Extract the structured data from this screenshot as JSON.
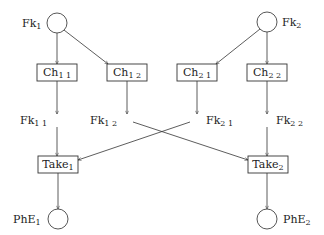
{
  "diagram": {
    "type": "petri-net",
    "places": [
      {
        "id": "Fk1",
        "base": "Fk",
        "sub": "1",
        "cx": 57,
        "cy": 23,
        "r": 10,
        "label_side": "left"
      },
      {
        "id": "Fk2",
        "base": "Fk",
        "sub": "2",
        "cx": 267,
        "cy": 22,
        "r": 10,
        "label_side": "right"
      },
      {
        "id": "PhE1",
        "base": "PhE",
        "sub": "1",
        "cx": 58,
        "cy": 219,
        "r": 10,
        "label_side": "left"
      },
      {
        "id": "PhE2",
        "base": "PhE",
        "sub": "2",
        "cx": 267,
        "cy": 219,
        "r": 10,
        "label_side": "right"
      }
    ],
    "intermediate_places": [
      {
        "id": "Fk11",
        "base": "Fk",
        "sub": "1 1",
        "x": 20,
        "y": 143
      },
      {
        "id": "Fk12",
        "base": "Fk",
        "sub": "1 2",
        "x": 90,
        "y": 143
      },
      {
        "id": "Fk21",
        "base": "Fk",
        "sub": "2 1",
        "x": 206,
        "y": 143
      },
      {
        "id": "Fk22",
        "base": "Fk",
        "sub": "2 2",
        "x": 276,
        "y": 143
      }
    ],
    "transitions": [
      {
        "id": "Ch11",
        "base": "Ch",
        "sub": "1 1",
        "x": 37,
        "y": 64,
        "w": 40,
        "h": 17
      },
      {
        "id": "Ch12",
        "base": "Ch",
        "sub": "1 2",
        "x": 107,
        "y": 64,
        "w": 40,
        "h": 17
      },
      {
        "id": "Ch21",
        "base": "Ch",
        "sub": "2 1",
        "x": 177,
        "y": 64,
        "w": 40,
        "h": 17
      },
      {
        "id": "Ch22",
        "base": "Ch",
        "sub": "2 2",
        "x": 247,
        "y": 64,
        "w": 40,
        "h": 17
      },
      {
        "id": "Take1",
        "base": "Take",
        "sub": "1",
        "x": 38,
        "y": 156,
        "w": 40,
        "h": 17
      },
      {
        "id": "Take2",
        "base": "Take",
        "sub": "2",
        "x": 248,
        "y": 156,
        "w": 40,
        "h": 17
      }
    ],
    "arcs": [
      {
        "from": "Fk1",
        "to": "Ch11"
      },
      {
        "from": "Fk1",
        "to": "Ch12"
      },
      {
        "from": "Fk2",
        "to": "Ch21"
      },
      {
        "from": "Fk2",
        "to": "Ch22"
      },
      {
        "from": "Ch11",
        "to": "Fk11"
      },
      {
        "from": "Ch12",
        "to": "Fk12"
      },
      {
        "from": "Ch21",
        "to": "Fk21"
      },
      {
        "from": "Ch22",
        "to": "Fk22"
      },
      {
        "from": "Fk11",
        "to": "Take1"
      },
      {
        "from": "Fk21",
        "to": "Take1"
      },
      {
        "from": "Fk12",
        "to": "Take2"
      },
      {
        "from": "Fk22",
        "to": "Take2"
      },
      {
        "from": "Take1",
        "to": "PhE1"
      },
      {
        "from": "Take2",
        "to": "PhE2"
      }
    ]
  },
  "labels": {
    "fk1": {
      "base": "Fk",
      "sub": "1"
    },
    "fk2": {
      "base": "Fk",
      "sub": "2"
    },
    "ch11": {
      "base": "Ch",
      "sub": "1 1"
    },
    "ch12": {
      "base": "Ch",
      "sub": "1 2"
    },
    "ch21": {
      "base": "Ch",
      "sub": "2 1"
    },
    "ch22": {
      "base": "Ch",
      "sub": "2 2"
    },
    "fk11": {
      "base": "Fk",
      "sub": "1 1"
    },
    "fk12": {
      "base": "Fk",
      "sub": "1 2"
    },
    "fk21": {
      "base": "Fk",
      "sub": "2 1"
    },
    "fk22": {
      "base": "Fk",
      "sub": "2 2"
    },
    "take1": {
      "base": "Take",
      "sub": "1"
    },
    "take2": {
      "base": "Take",
      "sub": "2"
    },
    "phe1": {
      "base": "PhE",
      "sub": "1"
    },
    "phe2": {
      "base": "PhE",
      "sub": "2"
    }
  }
}
